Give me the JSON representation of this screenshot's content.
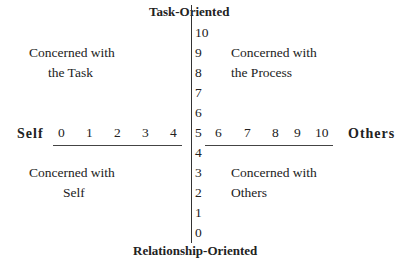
{
  "diagram": {
    "top_title": "Task-Oriented",
    "bottom_title": "Relationship-Oriented",
    "left_label": "Self",
    "right_label": "Others",
    "vertical_ticks": [
      "10",
      "9",
      "8",
      "7",
      "6",
      "5",
      "4",
      "3",
      "2",
      "1",
      "0"
    ],
    "left_ticks": [
      "0",
      "1",
      "2",
      "3",
      "4"
    ],
    "right_ticks": [
      "6",
      "7",
      "8",
      "9",
      "10"
    ],
    "quadrants": {
      "top_left": [
        "Concerned with",
        "the Task"
      ],
      "top_right": [
        "Concerned with",
        "the Process"
      ],
      "bottom_left": [
        "Concerned with",
        "Self"
      ],
      "bottom_right": [
        "Concerned with",
        "Others"
      ]
    }
  }
}
